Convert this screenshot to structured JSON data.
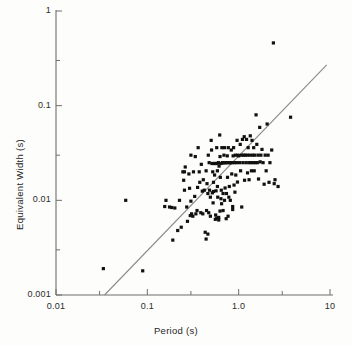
{
  "chart_data": {
    "type": "scatter",
    "title": "",
    "xlabel": "Period (s)",
    "ylabel": "Equivalent Width (s)",
    "xscale": "log",
    "yscale": "log",
    "xlim": [
      0.01,
      10
    ],
    "ylim": [
      0.001,
      1
    ],
    "grid": false,
    "legend": null,
    "xticks": [
      {
        "value": 0.01,
        "label": "0.01",
        "major": true
      },
      {
        "value": 0.03,
        "label": "",
        "major": false
      },
      {
        "value": 0.1,
        "label": "0.1",
        "major": true
      },
      {
        "value": 0.3,
        "label": "",
        "major": false
      },
      {
        "value": 1.0,
        "label": "1.0",
        "major": true
      },
      {
        "value": 3.0,
        "label": "",
        "major": false
      },
      {
        "value": 10,
        "label": "10",
        "major": true
      }
    ],
    "yticks": [
      {
        "value": 1,
        "label": "1",
        "major": true
      },
      {
        "value": 0.3,
        "label": "",
        "major": false
      },
      {
        "value": 0.1,
        "label": "0.1",
        "major": true
      },
      {
        "value": 0.03,
        "label": "",
        "major": false
      },
      {
        "value": 0.01,
        "label": "0.01",
        "major": true
      },
      {
        "value": 0.003,
        "label": "",
        "major": false
      },
      {
        "value": 0.001,
        "label": "0.001",
        "major": true
      }
    ],
    "marker": {
      "shape": "square",
      "size_px": 3.2,
      "color": "#111111"
    },
    "fit_line": {
      "type": "power-law",
      "color": "#8a8a8a",
      "width_px": 1.1,
      "x_start": 0.034,
      "y_start": 0.001,
      "x_end": 9.2,
      "y_end": 0.27
    },
    "points": [
      [
        0.033,
        0.0019
      ],
      [
        0.058,
        0.01
      ],
      [
        0.089,
        0.0018
      ],
      [
        0.16,
        0.01
      ],
      [
        0.155,
        0.0086
      ],
      [
        0.175,
        0.0085
      ],
      [
        0.19,
        0.0038
      ],
      [
        0.2,
        0.0083
      ],
      [
        0.215,
        0.0048
      ],
      [
        0.225,
        0.01
      ],
      [
        0.235,
        0.0052
      ],
      [
        0.245,
        0.02
      ],
      [
        0.25,
        0.0163
      ],
      [
        0.255,
        0.0128
      ],
      [
        0.26,
        0.0225
      ],
      [
        0.27,
        0.0085
      ],
      [
        0.275,
        0.006
      ],
      [
        0.285,
        0.019
      ],
      [
        0.29,
        0.0134
      ],
      [
        0.295,
        0.0069
      ],
      [
        0.3,
        0.03
      ],
      [
        0.305,
        0.0072
      ],
      [
        0.315,
        0.0068
      ],
      [
        0.32,
        0.02
      ],
      [
        0.33,
        0.011
      ],
      [
        0.335,
        0.029
      ],
      [
        0.34,
        0.0072
      ],
      [
        0.35,
        0.0078
      ],
      [
        0.355,
        0.0137
      ],
      [
        0.36,
        0.036
      ],
      [
        0.37,
        0.02
      ],
      [
        0.375,
        0.0155
      ],
      [
        0.385,
        0.0074
      ],
      [
        0.39,
        0.024
      ],
      [
        0.4,
        0.0125
      ],
      [
        0.405,
        0.0072
      ],
      [
        0.41,
        0.0165
      ],
      [
        0.42,
        0.0128
      ],
      [
        0.43,
        0.0046
      ],
      [
        0.44,
        0.0205
      ],
      [
        0.445,
        0.0078
      ],
      [
        0.45,
        0.015
      ],
      [
        0.46,
        0.0118
      ],
      [
        0.465,
        0.03
      ],
      [
        0.47,
        0.0074
      ],
      [
        0.475,
        0.025
      ],
      [
        0.48,
        0.0128
      ],
      [
        0.49,
        0.0068
      ],
      [
        0.5,
        0.043
      ],
      [
        0.505,
        0.034
      ],
      [
        0.51,
        0.0245
      ],
      [
        0.515,
        0.012
      ],
      [
        0.52,
        0.02
      ],
      [
        0.525,
        0.0094
      ],
      [
        0.53,
        0.0124
      ],
      [
        0.54,
        0.0245
      ],
      [
        0.545,
        0.0185
      ],
      [
        0.55,
        0.0245
      ],
      [
        0.56,
        0.007
      ],
      [
        0.565,
        0.0126
      ],
      [
        0.575,
        0.036
      ],
      [
        0.58,
        0.0245
      ],
      [
        0.585,
        0.014
      ],
      [
        0.59,
        0.0108
      ],
      [
        0.6,
        0.025
      ],
      [
        0.605,
        0.0062
      ],
      [
        0.61,
        0.023
      ],
      [
        0.62,
        0.049
      ],
      [
        0.625,
        0.029
      ],
      [
        0.63,
        0.0175
      ],
      [
        0.64,
        0.0245
      ],
      [
        0.645,
        0.0128
      ],
      [
        0.65,
        0.0092
      ],
      [
        0.655,
        0.036
      ],
      [
        0.665,
        0.025
      ],
      [
        0.67,
        0.025
      ],
      [
        0.675,
        0.0118
      ],
      [
        0.68,
        0.025
      ],
      [
        0.69,
        0.03
      ],
      [
        0.7,
        0.036
      ],
      [
        0.705,
        0.025
      ],
      [
        0.71,
        0.0135
      ],
      [
        0.72,
        0.025
      ],
      [
        0.73,
        0.0064
      ],
      [
        0.735,
        0.0118
      ],
      [
        0.74,
        0.025
      ],
      [
        0.75,
        0.0295
      ],
      [
        0.755,
        0.0175
      ],
      [
        0.765,
        0.0068
      ],
      [
        0.77,
        0.036
      ],
      [
        0.78,
        0.025
      ],
      [
        0.79,
        0.014
      ],
      [
        0.8,
        0.025
      ],
      [
        0.81,
        0.01
      ],
      [
        0.82,
        0.025
      ],
      [
        0.83,
        0.034
      ],
      [
        0.84,
        0.019
      ],
      [
        0.85,
        0.025
      ],
      [
        0.86,
        0.0086
      ],
      [
        0.87,
        0.0295
      ],
      [
        0.88,
        0.036
      ],
      [
        0.89,
        0.0145
      ],
      [
        0.9,
        0.025
      ],
      [
        0.91,
        0.0122
      ],
      [
        0.92,
        0.03
      ],
      [
        0.93,
        0.0185
      ],
      [
        0.95,
        0.025
      ],
      [
        0.96,
        0.043
      ],
      [
        0.97,
        0.0156
      ],
      [
        0.98,
        0.03
      ],
      [
        1.0,
        0.0295
      ],
      [
        1.02,
        0.025
      ],
      [
        1.04,
        0.039
      ],
      [
        1.05,
        0.0205
      ],
      [
        1.07,
        0.03
      ],
      [
        1.08,
        0.0085
      ],
      [
        1.1,
        0.044
      ],
      [
        1.11,
        0.025
      ],
      [
        1.13,
        0.03
      ],
      [
        1.15,
        0.047
      ],
      [
        1.16,
        0.0163
      ],
      [
        1.18,
        0.03
      ],
      [
        1.2,
        0.025
      ],
      [
        1.22,
        0.044
      ],
      [
        1.24,
        0.03
      ],
      [
        1.25,
        0.0195
      ],
      [
        1.27,
        0.036
      ],
      [
        1.29,
        0.025
      ],
      [
        1.3,
        0.0165
      ],
      [
        1.32,
        0.03
      ],
      [
        1.34,
        0.048
      ],
      [
        1.36,
        0.025
      ],
      [
        1.38,
        0.0205
      ],
      [
        1.4,
        0.043
      ],
      [
        1.42,
        0.03
      ],
      [
        1.44,
        0.025
      ],
      [
        1.46,
        0.036
      ],
      [
        1.48,
        0.0205
      ],
      [
        1.5,
        0.03
      ],
      [
        1.52,
        0.025
      ],
      [
        1.55,
        0.08
      ],
      [
        1.58,
        0.039
      ],
      [
        1.6,
        0.025
      ],
      [
        1.63,
        0.03
      ],
      [
        1.65,
        0.0168
      ],
      [
        1.7,
        0.059
      ],
      [
        1.72,
        0.0255
      ],
      [
        1.75,
        0.03
      ],
      [
        1.8,
        0.0345
      ],
      [
        1.85,
        0.025
      ],
      [
        1.9,
        0.0148
      ],
      [
        1.95,
        0.03
      ],
      [
        2.0,
        0.0205
      ],
      [
        2.05,
        0.064
      ],
      [
        2.1,
        0.03
      ],
      [
        2.15,
        0.0155
      ],
      [
        2.2,
        0.025
      ],
      [
        2.3,
        0.034
      ],
      [
        2.4,
        0.46
      ],
      [
        2.45,
        0.015
      ],
      [
        2.5,
        0.0165
      ],
      [
        2.7,
        0.014
      ],
      [
        3.7,
        0.0755
      ],
      [
        0.46,
        0.0044
      ],
      [
        0.185,
        0.0084
      ],
      [
        0.44,
        0.0039
      ],
      [
        0.625,
        0.0077
      ],
      [
        0.675,
        0.0078
      ],
      [
        0.86,
        0.008
      ],
      [
        0.7,
        0.01
      ],
      [
        0.64,
        0.0104
      ],
      [
        0.78,
        0.0108
      ],
      [
        0.3,
        0.0098
      ],
      [
        0.255,
        0.02
      ],
      [
        0.53,
        0.0155
      ],
      [
        0.585,
        0.0205
      ],
      [
        0.49,
        0.0108
      ],
      [
        0.555,
        0.0063
      ],
      [
        0.575,
        0.0065
      ],
      [
        0.605,
        0.0066
      ]
    ]
  },
  "axis": {
    "x_title": "Period (s)",
    "y_title": "Equivalent Width (s)",
    "x_tick_labels": [
      "0.01",
      "0.1",
      "1.0",
      "10"
    ],
    "y_tick_labels": [
      "1",
      "0.1",
      "0.01",
      "0.001"
    ]
  }
}
